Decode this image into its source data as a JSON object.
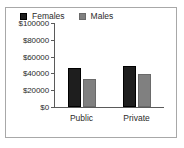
{
  "chart_data": {
    "type": "bar",
    "title": "",
    "xlabel": "",
    "ylabel": "",
    "categories": [
      "Public",
      "Private"
    ],
    "series": [
      {
        "name": "Females",
        "values": [
          47000,
          49000
        ],
        "color": "#1e1e1e"
      },
      {
        "name": "Males",
        "values": [
          33000,
          39000
        ],
        "color": "#808080"
      }
    ],
    "ylim": [
      0,
      100000
    ],
    "ytick_values": [
      0,
      20000,
      40000,
      60000,
      80000,
      100000
    ],
    "ytick_labels": [
      "$0",
      "$20000",
      "$40000",
      "$60000",
      "$80000",
      "$100000"
    ],
    "grid": false,
    "legend_position": "top-center",
    "border_color": "#a8a8a8",
    "axis_color": "#5a5a5a",
    "background": "#ffffff"
  }
}
